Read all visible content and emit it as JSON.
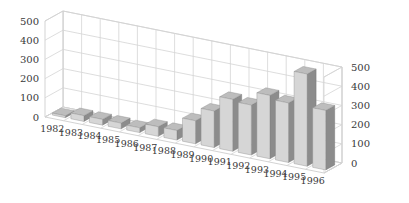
{
  "chart_data": {
    "type": "bar",
    "title": "",
    "xlabel": "",
    "ylabel": "",
    "categories": [
      "1982",
      "1983",
      "1984",
      "1985",
      "1986",
      "1987",
      "1988",
      "1989",
      "1990",
      "1991",
      "1992",
      "1993",
      "1994",
      "1995",
      "1996"
    ],
    "values": [
      10,
      30,
      30,
      30,
      25,
      50,
      50,
      120,
      190,
      270,
      260,
      330,
      310,
      480,
      310
    ],
    "ylim": [
      0,
      500
    ],
    "yticks": [
      0,
      100,
      200,
      300,
      400,
      500
    ],
    "ytick_labels": [
      "0",
      "100",
      "200",
      "300",
      "400",
      "500"
    ],
    "grid": true,
    "legend": null,
    "style": "3d",
    "axes": [
      "left",
      "right"
    ]
  },
  "colors": {
    "bar_front": "#d6d6d6",
    "bar_side": "#8c8c8c",
    "bar_top": "#bdbdbd",
    "grid": "#d4d4d4",
    "text": "#3a3a3a"
  }
}
